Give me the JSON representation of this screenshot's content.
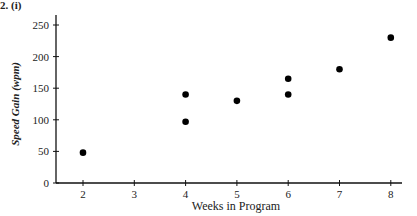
{
  "figure_label": "2.  (i)",
  "chart_data": {
    "type": "scatter",
    "title": "",
    "xlabel": "Weeks in Program",
    "ylabel": "Speed Gain (wpm)",
    "xlim": [
      1.45,
      8.3
    ],
    "ylim": [
      0,
      260
    ],
    "x_ticks": [
      2,
      3,
      4,
      5,
      6,
      7,
      8
    ],
    "y_ticks": [
      0,
      50,
      100,
      150,
      200,
      250
    ],
    "grid": false,
    "legend": null,
    "points": [
      {
        "x": 2,
        "y": 48
      },
      {
        "x": 4,
        "y": 97
      },
      {
        "x": 4,
        "y": 140
      },
      {
        "x": 5,
        "y": 130
      },
      {
        "x": 6,
        "y": 140
      },
      {
        "x": 6,
        "y": 165
      },
      {
        "x": 7,
        "y": 180
      },
      {
        "x": 8,
        "y": 230
      }
    ],
    "marker_color": "#000000"
  }
}
